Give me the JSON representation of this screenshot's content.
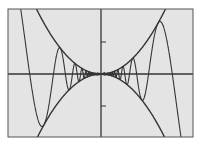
{
  "chart_data": {
    "type": "line",
    "title": "",
    "xlabel": "",
    "ylabel": "",
    "grid": false,
    "legend": null,
    "xlim": [
      -1.45,
      1.44
    ],
    "ylim": [
      -1.0,
      1.02
    ],
    "y_ticks": [
      -0.5,
      0.5
    ],
    "x_ticks": [],
    "series": [
      {
        "name": "upper envelope",
        "expression": "y = x^2",
        "coef": 1,
        "kind": "parabola"
      },
      {
        "name": "lower envelope",
        "expression": "y = -x^2",
        "coef": -1,
        "kind": "parabola"
      },
      {
        "name": "oscillating curve",
        "expression": "y = x^2 sin(7/x)",
        "c": 7,
        "kind": "oscillation"
      }
    ],
    "sample_points": {
      "x": [
        -1.2,
        -1.114,
        -0.89,
        -0.743,
        -0.6,
        0,
        0.6,
        0.743,
        0.89,
        1.114,
        1.2
      ],
      "y": [
        0.55,
        0.0,
        -0.79,
        0.0,
        0.29,
        0.0,
        -0.29,
        0.0,
        0.79,
        0.0,
        -0.55
      ]
    }
  },
  "style": {
    "background_outer": "#ffffff",
    "plot_background": "#e4e4e4",
    "line_color": "#353535",
    "frame_color": "#555555"
  },
  "layout": {
    "frame": {
      "left": 8,
      "top": 9,
      "right": 193,
      "bottom": 137
    },
    "origin_px": {
      "x": 101,
      "y": 74
    },
    "px_per_unit": 64
  }
}
